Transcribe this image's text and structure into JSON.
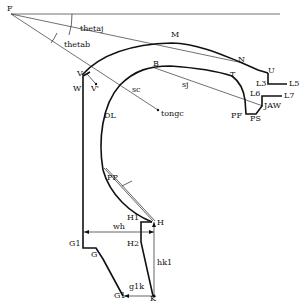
{
  "diagram": {
    "type": "geometric-profile-sketch",
    "labels": {
      "F": "F",
      "thetaj": "thetaj",
      "thetab": "thetab",
      "M": "M",
      "N": "N",
      "U": "U",
      "L3": "L3",
      "L5": "L5",
      "B": "B",
      "sj": "sj",
      "T": "T",
      "L6": "L6",
      "L7": "L7",
      "JAW": "JAW",
      "PF": "PF",
      "PS": "PS",
      "V": "V",
      "V_prime": "V'",
      "W": "W",
      "sc": "sc",
      "tongc": "tongc",
      "DL": "DL",
      "PP": "PP",
      "H1": "H1",
      "H": "H",
      "H2": "H2",
      "wh": "wh",
      "hk1": "hk1",
      "G1_upper": "G1",
      "G": "G",
      "G1_lower": "G1",
      "g1k": "g1k",
      "K": "K"
    },
    "colors": {
      "line": "#111111",
      "background": "#ffffff"
    }
  }
}
